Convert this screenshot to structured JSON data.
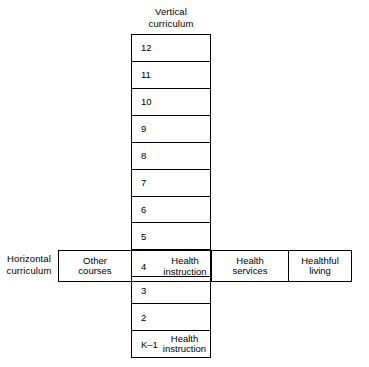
{
  "vertical": {
    "title_line1": "Vertical",
    "title_line2": "curriculum",
    "rows": [
      {
        "grade": "12",
        "note_line1": "",
        "note_line2": ""
      },
      {
        "grade": "11",
        "note_line1": "",
        "note_line2": ""
      },
      {
        "grade": "10",
        "note_line1": "",
        "note_line2": ""
      },
      {
        "grade": "9",
        "note_line1": "",
        "note_line2": ""
      },
      {
        "grade": "8",
        "note_line1": "",
        "note_line2": ""
      },
      {
        "grade": "7",
        "note_line1": "",
        "note_line2": ""
      },
      {
        "grade": "6",
        "note_line1": "",
        "note_line2": ""
      },
      {
        "grade": "5",
        "note_line1": "",
        "note_line2": ""
      },
      {
        "grade": "4",
        "note_line1": "Health",
        "note_line2": "instruction"
      },
      {
        "grade": "3",
        "note_line1": "",
        "note_line2": ""
      },
      {
        "grade": "2",
        "note_line1": "",
        "note_line2": ""
      },
      {
        "grade": "K–1",
        "note_line1": "Health",
        "note_line2": "instruction"
      }
    ]
  },
  "horizontal": {
    "title_line1": "Horizontal",
    "title_line2": "curriculum",
    "cells": [
      {
        "line1": "Other",
        "line2": "courses"
      },
      {
        "line1": "Health",
        "line2": "instruction"
      },
      {
        "line1": "Health",
        "line2": "services"
      },
      {
        "line1": "Healthful",
        "line2": "living"
      }
    ]
  },
  "colors": {
    "stroke": "#000000",
    "background": "#ffffff",
    "text": "#000000"
  }
}
